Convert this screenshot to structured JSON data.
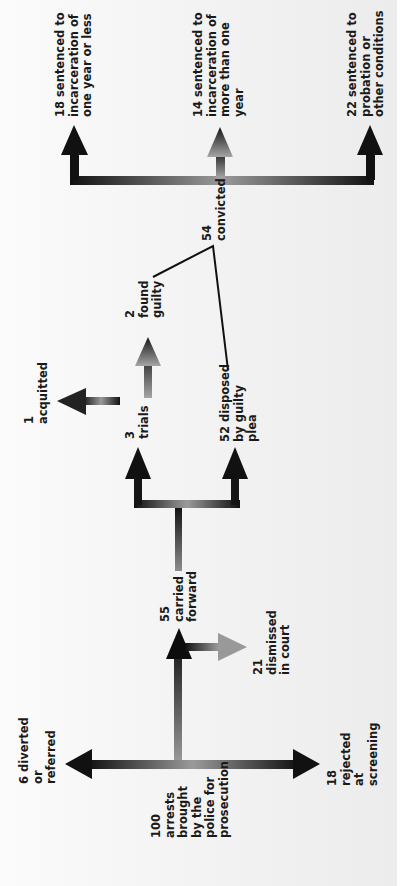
{
  "diagram": {
    "title": "",
    "orientation": "rotated 90 degrees counter-clockwise",
    "colors": {
      "arrow_dark": "#111111",
      "arrow_light": "#9a9a9a",
      "background": "#f0f0f0",
      "connector_line": "#111111"
    },
    "nodes": {
      "arrests": {
        "count": "100",
        "lines": [
          "100",
          "arrests",
          "brought",
          "by the",
          "police for",
          "prosecution"
        ]
      },
      "diverted": {
        "count": "6",
        "lines": [
          "6 diverted",
          "or",
          "referred"
        ]
      },
      "rejected": {
        "count": "18",
        "lines": [
          "18",
          "rejected",
          "at",
          "screening"
        ]
      },
      "carried_forward": {
        "count": "55",
        "lines": [
          "55",
          "carried",
          "forward"
        ]
      },
      "dismissed": {
        "count": "21",
        "lines": [
          "21",
          "dismissed",
          "in court"
        ]
      },
      "trials": {
        "count": "3",
        "lines": [
          "3",
          "trials"
        ]
      },
      "guilty_plea": {
        "count": "52",
        "lines": [
          "52 disposed",
          "by guilty",
          "plea"
        ]
      },
      "acquitted": {
        "count": "1",
        "lines": [
          "1",
          "acquitted"
        ]
      },
      "found_guilty": {
        "count": "2",
        "lines": [
          "2",
          "found",
          "guilty"
        ]
      },
      "convicted": {
        "count": "54",
        "lines": [
          "54",
          "convicted"
        ]
      },
      "sentence_short": {
        "count": "18",
        "lines": [
          "18 sentenced to",
          "incarceration of",
          "one year or less"
        ]
      },
      "sentence_long": {
        "count": "14",
        "lines": [
          "14 sentenced to",
          "incarceration of",
          "more than one",
          "year"
        ]
      },
      "sentence_probation": {
        "count": "22",
        "lines": [
          "22 sentenced to",
          "probation or",
          "other conditions"
        ]
      }
    }
  }
}
